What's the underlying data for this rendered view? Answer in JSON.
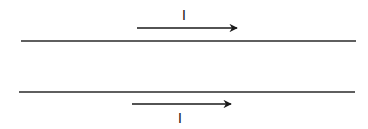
{
  "diagram": {
    "wires": [
      {
        "name": "top-wire",
        "line": {
          "x1": 21,
          "y1": 41,
          "x2": 356,
          "y2": 41
        },
        "current": {
          "label": "I",
          "direction": "right",
          "arrow": {
            "x1": 137,
            "y1": 28,
            "x2": 237,
            "y2": 28
          },
          "label_pos": {
            "x": 184,
            "y": 20
          }
        }
      },
      {
        "name": "bottom-wire",
        "line": {
          "x1": 19,
          "y1": 92,
          "x2": 355,
          "y2": 92
        },
        "current": {
          "label": "I",
          "direction": "right",
          "arrow": {
            "x1": 132,
            "y1": 104,
            "x2": 231,
            "y2": 104
          },
          "label_pos": {
            "x": 180,
            "y": 123
          }
        }
      }
    ],
    "colors": {
      "line": "#2a2a2a",
      "arrow": "#1a1a1a",
      "text": "#111111",
      "background": "#ffffff"
    }
  }
}
